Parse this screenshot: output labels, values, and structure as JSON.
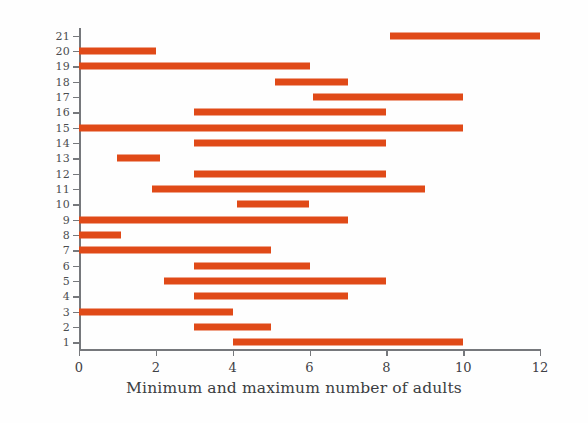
{
  "chart_data": {
    "type": "bar",
    "orientation": "horizontal",
    "title": "",
    "subtitle": "",
    "xlabel": "Minimum and maximum number of adults",
    "ylabel": "Social group",
    "xlim": [
      0,
      12
    ],
    "ylim": [
      0.5,
      21.5
    ],
    "xticks": [
      0,
      2,
      4,
      6,
      8,
      10,
      12
    ],
    "xtick_labels": [
      "0",
      "2",
      "4",
      "6",
      "8",
      "10",
      "12"
    ],
    "yticks": [
      1,
      2,
      3,
      4,
      5,
      6,
      7,
      8,
      9,
      10,
      11,
      12,
      13,
      14,
      15,
      16,
      17,
      18,
      19,
      20,
      21
    ],
    "ytick_labels": [
      "1",
      "2",
      "3",
      "4",
      "5",
      "6",
      "7",
      "8",
      "9",
      "10",
      "11",
      "12",
      "13",
      "14",
      "15",
      "16",
      "17",
      "18",
      "19",
      "20",
      "21"
    ],
    "grid": false,
    "legend": null,
    "bar_color": "#e04a18",
    "axis_color": "#76787c",
    "categories": [
      "1",
      "2",
      "3",
      "4",
      "5",
      "6",
      "7",
      "8",
      "9",
      "10",
      "11",
      "12",
      "13",
      "14",
      "15",
      "16",
      "17",
      "18",
      "19",
      "20",
      "21"
    ],
    "series": [
      {
        "name": "Minimum and maximum number of adults",
        "ranges": [
          {
            "group": 1,
            "min": 4,
            "max": 10
          },
          {
            "group": 2,
            "min": 3,
            "max": 5
          },
          {
            "group": 3,
            "min": 0,
            "max": 4
          },
          {
            "group": 4,
            "min": 3,
            "max": 7
          },
          {
            "group": 5,
            "min": 2.2,
            "max": 8
          },
          {
            "group": 6,
            "min": 3,
            "max": 6
          },
          {
            "group": 7,
            "min": 0,
            "max": 5
          },
          {
            "group": 8,
            "min": 0,
            "max": 1.1
          },
          {
            "group": 9,
            "min": 0,
            "max": 7
          },
          {
            "group": 10,
            "min": 4.1,
            "max": 6
          },
          {
            "group": 11,
            "min": 1.9,
            "max": 9
          },
          {
            "group": 12,
            "min": 3,
            "max": 8
          },
          {
            "group": 13,
            "min": 1,
            "max": 2.1
          },
          {
            "group": 14,
            "min": 3,
            "max": 8
          },
          {
            "group": 15,
            "min": 0,
            "max": 10
          },
          {
            "group": 16,
            "min": 3,
            "max": 8
          },
          {
            "group": 17,
            "min": 6.1,
            "max": 10
          },
          {
            "group": 18,
            "min": 5.1,
            "max": 7
          },
          {
            "group": 19,
            "min": 0,
            "max": 6
          },
          {
            "group": 20,
            "min": 0,
            "max": 2
          },
          {
            "group": 21,
            "min": 8.1,
            "max": 12
          }
        ]
      }
    ]
  }
}
